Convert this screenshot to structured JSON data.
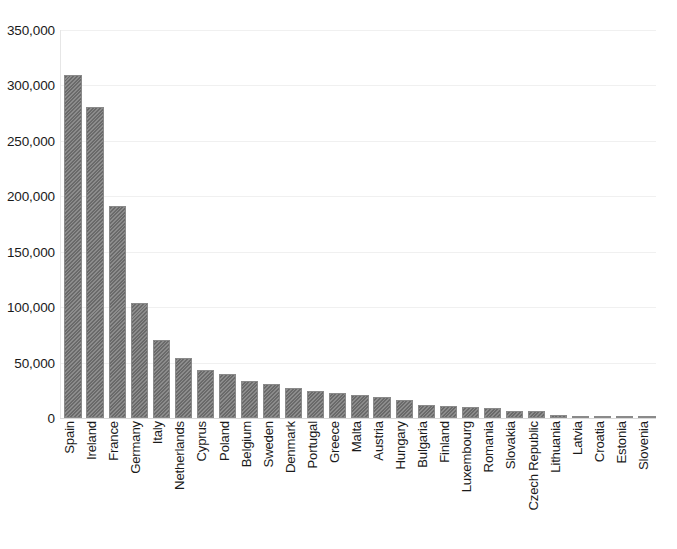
{
  "chart_data": {
    "type": "bar",
    "title": "",
    "subtitle": "",
    "xlabel": "",
    "ylabel": "",
    "ylim": [
      0,
      350000
    ],
    "grid": true,
    "legend": false,
    "orientation": "vertical",
    "bar_color": "#767676",
    "bar_pattern": "diagonal-hatch",
    "y_ticks": [
      0,
      50000,
      100000,
      150000,
      200000,
      250000,
      300000,
      350000
    ],
    "y_tick_labels": [
      "0",
      "50,000",
      "100,000",
      "150,000",
      "200,000",
      "250,000",
      "300,000",
      "350,000"
    ],
    "categories": [
      "Spain",
      "Ireland",
      "France",
      "Germany",
      "Italy",
      "Netherlands",
      "Cyprus",
      "Poland",
      "Belgium",
      "Sweden",
      "Denmark",
      "Portugal",
      "Greece",
      "Malta",
      "Austria",
      "Hungary",
      "Bulgaria",
      "Finland",
      "Luxembourg",
      "Romania",
      "Slovakia",
      "Czech Republic",
      "Lithuania",
      "Latvia",
      "Croatia",
      "Estonia",
      "Slovenia"
    ],
    "values": [
      309000,
      281000,
      191000,
      104000,
      70000,
      54000,
      43000,
      40000,
      33000,
      31000,
      27000,
      24000,
      23000,
      21000,
      19000,
      16000,
      12000,
      11000,
      9500,
      9000,
      6500,
      6000,
      3000,
      600,
      400,
      300,
      200
    ]
  }
}
